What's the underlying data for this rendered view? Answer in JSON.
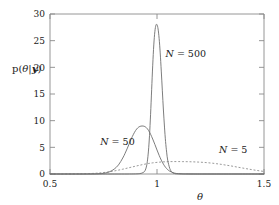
{
  "chart_data": {
    "type": "line",
    "title": "",
    "subtitle": "",
    "xlabel": "θ",
    "ylabel": "p(θ|y)",
    "xlim": [
      0.5,
      1.5
    ],
    "ylim": [
      0,
      30
    ],
    "xticks": [
      0.5,
      1,
      1.5
    ],
    "xtick_labels": [
      "0.5",
      "1",
      "1.5"
    ],
    "yticks": [
      0,
      5,
      10,
      15,
      20,
      25,
      30
    ],
    "ytick_labels": [
      "0",
      "5",
      "10",
      "15",
      "20",
      "25",
      "30"
    ],
    "grid": false,
    "legend_position": "inline-annotations",
    "annotations": [
      {
        "text": "N = 500",
        "x": 1.04,
        "y": 22.0
      },
      {
        "text": "N = 50",
        "x": 0.735,
        "y": 5.4
      },
      {
        "text": "N = 5",
        "x": 1.29,
        "y": 4.0
      }
    ],
    "series": [
      {
        "name": "N = 5",
        "label": "N = 5",
        "style": "dotted",
        "color": "#8f8f8f",
        "peak_x": 1.15,
        "peak_y": 2.3,
        "x": [
          0.5,
          0.52,
          0.54,
          0.56,
          0.58,
          0.6,
          0.62,
          0.64,
          0.66,
          0.68,
          0.7,
          0.72,
          0.74,
          0.76,
          0.78,
          0.8,
          0.82,
          0.84,
          0.86,
          0.88,
          0.9,
          0.92,
          0.94,
          0.96,
          0.98,
          1.0,
          1.02,
          1.04,
          1.06,
          1.08,
          1.1,
          1.12,
          1.14,
          1.16,
          1.18,
          1.2,
          1.22,
          1.24,
          1.26,
          1.28,
          1.3,
          1.32,
          1.34,
          1.36,
          1.38,
          1.4,
          1.42,
          1.44,
          1.46,
          1.48,
          1.5
        ],
        "y": [
          0.0,
          0.0,
          0.0,
          0.0,
          0.01,
          0.01,
          0.02,
          0.03,
          0.05,
          0.07,
          0.11,
          0.16,
          0.23,
          0.32,
          0.43,
          0.57,
          0.73,
          0.9,
          1.09,
          1.28,
          1.47,
          1.65,
          1.82,
          1.97,
          2.09,
          2.18,
          2.25,
          2.29,
          2.32,
          2.33,
          2.33,
          2.32,
          2.31,
          2.29,
          2.26,
          2.22,
          2.17,
          2.1,
          2.02,
          1.92,
          1.81,
          1.68,
          1.55,
          1.41,
          1.26,
          1.12,
          0.98,
          0.84,
          0.71,
          0.59,
          0.48
        ]
      },
      {
        "name": "N = 50",
        "label": "N = 50",
        "style": "solid",
        "color": "#6e6e6e",
        "peak_x": 0.94,
        "peak_y": 9.0,
        "x": [
          0.5,
          0.54,
          0.58,
          0.62,
          0.66,
          0.7,
          0.72,
          0.74,
          0.76,
          0.78,
          0.8,
          0.82,
          0.84,
          0.85,
          0.86,
          0.87,
          0.88,
          0.89,
          0.9,
          0.91,
          0.92,
          0.93,
          0.94,
          0.95,
          0.96,
          0.97,
          0.98,
          0.99,
          1.0,
          1.01,
          1.02,
          1.03,
          1.04,
          1.05,
          1.06,
          1.08,
          1.1,
          1.12,
          1.14,
          1.18,
          1.22,
          1.3,
          1.4,
          1.5
        ],
        "y": [
          0.0,
          0.0,
          0.0,
          0.0,
          0.0,
          0.01,
          0.03,
          0.08,
          0.2,
          0.45,
          0.92,
          1.7,
          3.0,
          3.8,
          4.7,
          5.65,
          6.6,
          7.45,
          8.15,
          8.65,
          8.92,
          9.0,
          8.95,
          8.7,
          8.2,
          7.45,
          6.55,
          5.55,
          4.5,
          3.5,
          2.6,
          1.85,
          1.25,
          0.82,
          0.52,
          0.18,
          0.06,
          0.02,
          0.01,
          0.0,
          0.0,
          0.0,
          0.0,
          0.0
        ]
      },
      {
        "name": "N = 500",
        "label": "N = 500",
        "style": "solid",
        "color": "#6e6e6e",
        "peak_x": 1.0,
        "peak_y": 28.0,
        "x": [
          0.5,
          0.7,
          0.8,
          0.86,
          0.9,
          0.92,
          0.93,
          0.94,
          0.945,
          0.95,
          0.955,
          0.96,
          0.965,
          0.97,
          0.975,
          0.98,
          0.985,
          0.99,
          0.995,
          1.0,
          1.005,
          1.01,
          1.015,
          1.02,
          1.025,
          1.03,
          1.035,
          1.04,
          1.045,
          1.05,
          1.06,
          1.07,
          1.08,
          1.1,
          1.2,
          1.5
        ],
        "y": [
          0.0,
          0.0,
          0.0,
          0.0,
          0.02,
          0.08,
          0.18,
          0.4,
          0.7,
          1.3,
          2.4,
          4.3,
          7.2,
          11.2,
          15.8,
          20.4,
          24.2,
          26.7,
          27.9,
          28.0,
          27.2,
          25.4,
          22.7,
          19.3,
          15.6,
          12.0,
          8.8,
          6.1,
          4.1,
          2.6,
          1.0,
          0.35,
          0.12,
          0.02,
          0.0,
          0.0
        ]
      }
    ]
  },
  "axes": {
    "frame_color": "#8a8a8a",
    "text_color": "#1a1a1a"
  }
}
